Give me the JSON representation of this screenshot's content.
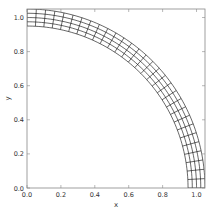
{
  "chart_data": {
    "type": "line",
    "title": "",
    "xlabel": "x",
    "ylabel": "y",
    "xlim": [
      0.0,
      1.05
    ],
    "ylim": [
      0.0,
      1.05
    ],
    "xticks": [
      "0.0",
      "0.2",
      "0.4",
      "0.6",
      "0.8",
      "1.0"
    ],
    "yticks": [
      "0.0",
      "0.2",
      "0.4",
      "0.6",
      "0.8",
      "1.0"
    ],
    "grid": false,
    "legend": null,
    "mesh": {
      "r_inner": 0.95,
      "r_outer": 1.05,
      "radial_lines": 5,
      "theta_start_deg": 0,
      "theta_end_deg": 90,
      "angular_lines": 31,
      "line_color": "#000000"
    }
  },
  "axes": {
    "frame_color": "#888888"
  }
}
